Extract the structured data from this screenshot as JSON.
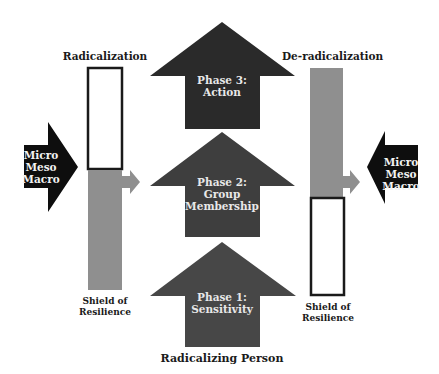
{
  "labels": {
    "left_title": "Radicalization",
    "right_title": "De-radicalization",
    "left_shield": [
      "Shield of",
      "Resilience"
    ],
    "right_shield": [
      "Shield of",
      "Resilience"
    ],
    "bottom": "Radicalizing Person"
  },
  "left_influence": [
    "Micro",
    "Meso",
    "Macro"
  ],
  "right_influence": [
    "Micro",
    "Meso",
    "Macro"
  ],
  "phases": [
    {
      "lines": [
        "Phase 3:",
        "Action"
      ]
    },
    {
      "lines": [
        "Phase 2:",
        "Group",
        "Membership"
      ]
    },
    {
      "lines": [
        "Phase 1:",
        "Sensitivity"
      ]
    }
  ],
  "colors": {
    "influence_arrow": "#0e0e0e",
    "phase3": "#2a2a2a",
    "phase2": "#3e3e3e",
    "phase1": "#474747",
    "shield_gray": "#8f8f8f",
    "box_border": "#1a1a1a"
  }
}
